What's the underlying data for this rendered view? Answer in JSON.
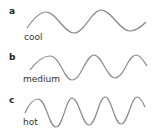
{
  "panels": [
    {
      "letter": "a",
      "label": "cool",
      "description": "low-frequency wave",
      "cycles": 2
    },
    {
      "letter": "b",
      "label": "medium",
      "description": "medium-frequency wave",
      "cycles": 2.5
    },
    {
      "letter": "c",
      "label": "hot",
      "description": "high-frequency wave",
      "cycles": 4
    }
  ],
  "colors": {
    "wave": "#8a8a8a",
    "text": "#333333"
  }
}
